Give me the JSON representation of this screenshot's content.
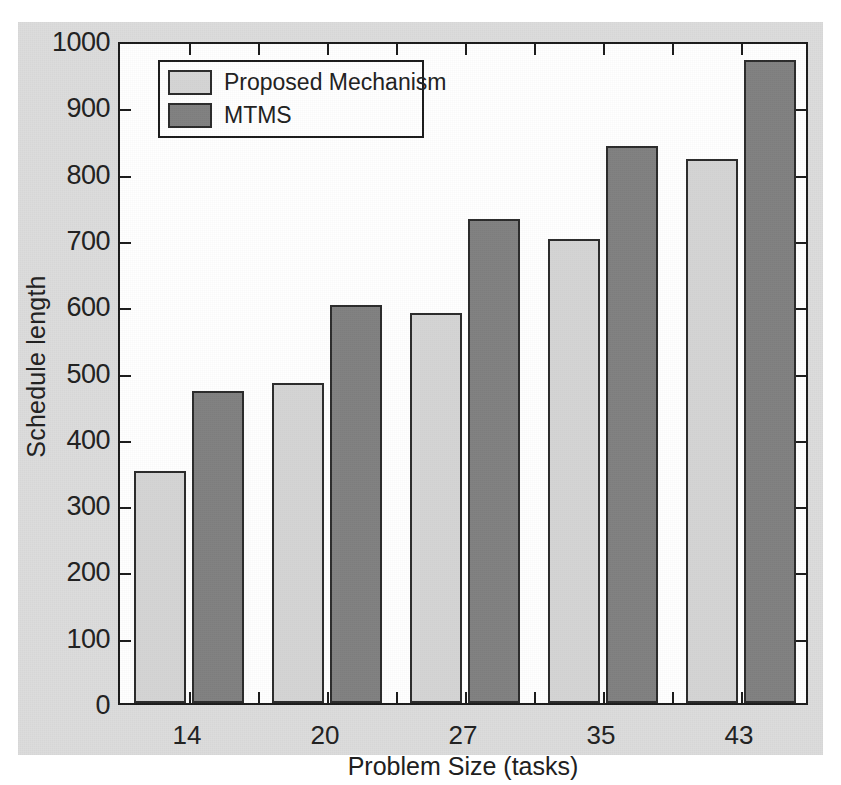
{
  "chart_data": {
    "type": "bar",
    "title": "",
    "xlabel": "Problem Size (tasks)",
    "ylabel": "Schedule length",
    "categories": [
      "14",
      "20",
      "27",
      "35",
      "43"
    ],
    "series": [
      {
        "name": "Proposed Mechanism",
        "color": "#d4d4d4",
        "values": [
          350,
          482,
          588,
          700,
          820
        ]
      },
      {
        "name": "MTMS",
        "color": "#808080",
        "values": [
          470,
          600,
          730,
          840,
          970
        ]
      }
    ],
    "ylim": [
      0,
      1000
    ],
    "y_ticks": [
      0,
      100,
      200,
      300,
      400,
      500,
      600,
      700,
      800,
      900,
      1000
    ],
    "y_tick_labels": [
      "0",
      "100",
      "200",
      "300",
      "400",
      "500",
      "600",
      "700",
      "800",
      "900",
      "1000"
    ],
    "grid": false,
    "legend_position": "top-left",
    "bar_edge_color": "#2a2a2a",
    "plot_background": "#ffffff",
    "figure_background": "#dcdcdc",
    "axis_color": "#1a1a1a"
  },
  "legend": {
    "entries": [
      {
        "label": "Proposed Mechanism",
        "color": "#d4d4d4"
      },
      {
        "label": "MTMS",
        "color": "#808080"
      }
    ]
  }
}
